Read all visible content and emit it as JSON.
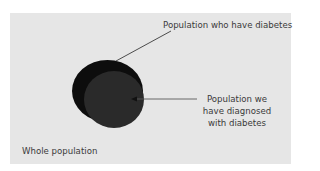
{
  "diagram": {
    "type": "nested-circles",
    "colors": {
      "page_background": "#ffffff",
      "panel_background": "#e6e6e6",
      "outer_circle": "#0d0d0d",
      "inner_circle": "#2a2a2a",
      "leader_line": "#3a3a3a",
      "text": "#3a3a3a"
    },
    "labels": {
      "population_with_diabetes": "Population who have diabetes",
      "population_diagnosed": "Population we have diagnosed with diabetes",
      "whole_population": "Whole population"
    }
  }
}
